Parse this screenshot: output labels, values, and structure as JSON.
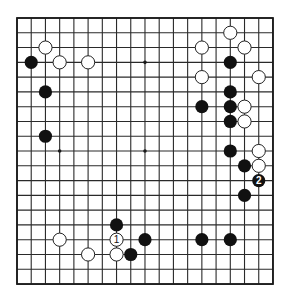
{
  "diagram": {
    "type": "go-board",
    "size": 19,
    "colors": {
      "background": "#ffffff",
      "lines": "#2a2a2a",
      "black": "#111111",
      "white": "#ffffff"
    },
    "geometry": {
      "x0": 17,
      "y0": 18,
      "dx": 14.22,
      "dy": 14.78,
      "stone_radius": 6.6
    },
    "star_points": [
      [
        3,
        3
      ],
      [
        9,
        3
      ],
      [
        15,
        3
      ],
      [
        3,
        9
      ],
      [
        9,
        9
      ],
      [
        15,
        9
      ],
      [
        3,
        15
      ],
      [
        9,
        15
      ],
      [
        15,
        15
      ]
    ],
    "stones": [
      {
        "color": "white",
        "col": 2,
        "row": 2
      },
      {
        "color": "black",
        "col": 1,
        "row": 3
      },
      {
        "color": "white",
        "col": 3,
        "row": 3
      },
      {
        "color": "white",
        "col": 5,
        "row": 3
      },
      {
        "color": "black",
        "col": 2,
        "row": 5
      },
      {
        "color": "black",
        "col": 2,
        "row": 8
      },
      {
        "color": "white",
        "col": 15,
        "row": 1
      },
      {
        "color": "white",
        "col": 13,
        "row": 2
      },
      {
        "color": "white",
        "col": 16,
        "row": 2
      },
      {
        "color": "black",
        "col": 15,
        "row": 3
      },
      {
        "color": "white",
        "col": 13,
        "row": 4
      },
      {
        "color": "white",
        "col": 17,
        "row": 4
      },
      {
        "color": "black",
        "col": 15,
        "row": 5
      },
      {
        "color": "black",
        "col": 13,
        "row": 6
      },
      {
        "color": "black",
        "col": 15,
        "row": 6
      },
      {
        "color": "white",
        "col": 16,
        "row": 6
      },
      {
        "color": "black",
        "col": 15,
        "row": 7
      },
      {
        "color": "white",
        "col": 16,
        "row": 7
      },
      {
        "color": "black",
        "col": 15,
        "row": 9
      },
      {
        "color": "white",
        "col": 17,
        "row": 9
      },
      {
        "color": "black",
        "col": 16,
        "row": 10
      },
      {
        "color": "white",
        "col": 17,
        "row": 10
      },
      {
        "color": "black",
        "col": 17,
        "row": 11,
        "label": "2"
      },
      {
        "color": "black",
        "col": 16,
        "row": 12
      },
      {
        "color": "black",
        "col": 7,
        "row": 14
      },
      {
        "color": "white",
        "col": 3,
        "row": 15
      },
      {
        "color": "white",
        "col": 7,
        "row": 15,
        "label": "1"
      },
      {
        "color": "black",
        "col": 9,
        "row": 15
      },
      {
        "color": "black",
        "col": 13,
        "row": 15
      },
      {
        "color": "black",
        "col": 15,
        "row": 15
      },
      {
        "color": "white",
        "col": 5,
        "row": 16
      },
      {
        "color": "white",
        "col": 7,
        "row": 16
      },
      {
        "color": "black",
        "col": 8,
        "row": 16
      }
    ],
    "move_labels": [
      "1",
      "2"
    ]
  }
}
